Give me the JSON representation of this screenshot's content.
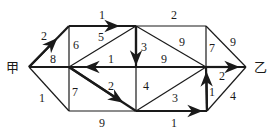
{
  "diagram": {
    "type": "weighted-directed-graph",
    "nodes": {
      "start": {
        "label": "甲",
        "x": 29,
        "y": 67
      },
      "A": {
        "x": 69,
        "y": 26
      },
      "B": {
        "x": 136,
        "y": 26
      },
      "C": {
        "x": 206,
        "y": 26
      },
      "D": {
        "x": 69,
        "y": 67
      },
      "E": {
        "x": 136,
        "y": 67
      },
      "F": {
        "x": 206,
        "y": 67
      },
      "end": {
        "label": "乙",
        "x": 246,
        "y": 67
      },
      "G": {
        "x": 69,
        "y": 111
      },
      "H": {
        "x": 136,
        "y": 111
      },
      "I": {
        "x": 207,
        "y": 111
      }
    },
    "edges": [
      {
        "from": "start",
        "to": "A",
        "weight": "2",
        "arrow": true
      },
      {
        "from": "A",
        "to": "B",
        "weight": "1",
        "arrow": true
      },
      {
        "from": "B",
        "to": "C",
        "weight": "2",
        "arrow": false
      },
      {
        "from": "A",
        "to": "D",
        "weight": "6",
        "arrow": false
      },
      {
        "from": "D",
        "to": "B",
        "weight": "5",
        "arrow": false
      },
      {
        "from": "B",
        "to": "E",
        "weight": "3",
        "arrow": true
      },
      {
        "from": "B",
        "to": "F",
        "weight": "9",
        "arrow": false
      },
      {
        "from": "C",
        "to": "F",
        "weight": "7",
        "arrow": false
      },
      {
        "from": "C",
        "to": "end",
        "weight": "9",
        "arrow": false
      },
      {
        "from": "start",
        "to": "D",
        "weight": "8",
        "arrow": false
      },
      {
        "from": "E",
        "to": "D",
        "weight": "1",
        "arrow": true
      },
      {
        "from": "E",
        "to": "F",
        "weight": "9",
        "arrow": false
      },
      {
        "from": "F",
        "to": "end",
        "weight": "2",
        "arrow": true
      },
      {
        "from": "start",
        "to": "G",
        "weight": "1",
        "arrow": false
      },
      {
        "from": "D",
        "to": "G",
        "weight": "7",
        "arrow": false
      },
      {
        "from": "D",
        "to": "H",
        "weight": "2",
        "arrow": true
      },
      {
        "from": "E",
        "to": "H",
        "weight": "4",
        "arrow": false
      },
      {
        "from": "H",
        "to": "F",
        "weight": "3",
        "arrow": false
      },
      {
        "from": "I",
        "to": "F",
        "weight": "1",
        "arrow": true
      },
      {
        "from": "I",
        "to": "end",
        "weight": "4",
        "arrow": false
      },
      {
        "from": "G",
        "to": "H",
        "weight": "9",
        "arrow": false
      },
      {
        "from": "H",
        "to": "I",
        "weight": "1",
        "arrow": true
      }
    ]
  },
  "labels": {
    "start": "甲",
    "end": "乙",
    "w_start_A": "2",
    "w_A_B": "1",
    "w_B_C": "2",
    "w_A_D": "6",
    "w_D_B": "5",
    "w_B_E": "3",
    "w_B_F": "9",
    "w_C_F": "7",
    "w_C_end": "9",
    "w_start_D": "8",
    "w_E_D": "1",
    "w_E_F": "9",
    "w_F_end": "2",
    "w_start_G": "1",
    "w_D_G": "7",
    "w_D_H": "2",
    "w_E_H": "4",
    "w_H_F": "3",
    "w_I_F": "1",
    "w_I_end": "4",
    "w_G_H": "9",
    "w_H_I": "1"
  }
}
